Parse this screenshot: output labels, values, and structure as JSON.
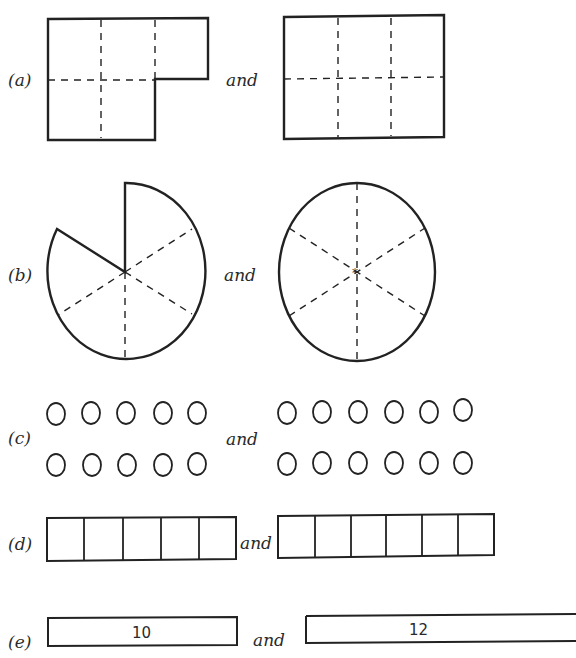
{
  "figure": {
    "rows": [
      {
        "id": "a",
        "label": "(a)",
        "connector": "and",
        "left": "L-shaped region of 5 unit squares (3 top, 2 bottom)",
        "right": "rectangle of 6 unit squares (3x2)"
      },
      {
        "id": "b",
        "label": "(b)",
        "connector": "and",
        "left": "circle with 5 of 6 sectors",
        "right": "whole circle divided into 6 sectors"
      },
      {
        "id": "c",
        "label": "(c)",
        "connector": "and",
        "left_count": 10,
        "right_count": 12,
        "left_layout": "2 rows x 5",
        "right_layout": "2 rows x 6"
      },
      {
        "id": "d",
        "label": "(d)",
        "connector": "and",
        "left_cells": 5,
        "right_cells": 6
      },
      {
        "id": "e",
        "label": "(e)",
        "connector": "and",
        "left_value": "10",
        "right_value": "12"
      }
    ]
  }
}
